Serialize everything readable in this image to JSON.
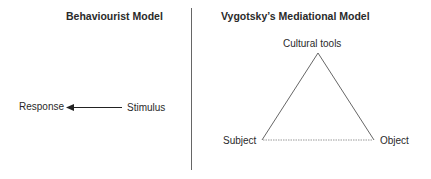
{
  "left_panel": {
    "title": "Behaviourist Model",
    "response_label": "Response",
    "stimulus_label": "Stimulus",
    "arrow_direction": "stimulus-to-response"
  },
  "right_panel": {
    "title": "Vygotsky’s Mediational Model",
    "apex_label": "Cultural tools",
    "left_vertex_label": "Subject",
    "right_vertex_label": "Object",
    "base_line_style": "dotted"
  },
  "colors": {
    "line": "#555555",
    "divider": "#666666",
    "dotted_base": "#999999",
    "text": "#2a2a2a"
  }
}
